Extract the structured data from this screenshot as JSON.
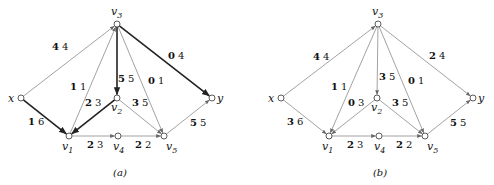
{
  "diagrams": [
    {
      "caption": "(a)",
      "caption_pos": [
        120,
        176
      ],
      "nodes": {
        "x": {
          "label": "x",
          "pos": [
            21,
            98
          ],
          "lpos": [
            8,
            102
          ]
        },
        "v1": {
          "label": "v1",
          "pos": [
            69,
            136
          ],
          "lpos": [
            62,
            150
          ]
        },
        "v2": {
          "label": "v2",
          "pos": [
            117,
            98
          ],
          "lpos": [
            111,
            111
          ]
        },
        "v3": {
          "label": "v3",
          "pos": [
            117,
            24
          ],
          "lpos": [
            111,
            15
          ]
        },
        "v4": {
          "label": "v4",
          "pos": [
            118,
            136
          ],
          "lpos": [
            113,
            150
          ]
        },
        "v5": {
          "label": "v5",
          "pos": [
            164,
            136
          ],
          "lpos": [
            166,
            150
          ]
        },
        "y": {
          "label": "y",
          "pos": [
            212,
            98
          ],
          "lpos": [
            217,
            102
          ]
        }
      },
      "edges": [
        {
          "from": "x",
          "to": "v3",
          "flow": "4",
          "cap": "4",
          "heavy": false,
          "lpos": [
            52,
            50
          ]
        },
        {
          "from": "x",
          "to": "v1",
          "flow": "1",
          "cap": "6",
          "heavy": true,
          "lpos": [
            28,
            125
          ]
        },
        {
          "from": "v1",
          "to": "v3",
          "flow": "1",
          "cap": "1",
          "heavy": false,
          "lpos": [
            70,
            90
          ]
        },
        {
          "from": "v2",
          "to": "v1",
          "flow": "2",
          "cap": "3",
          "heavy": true,
          "lpos": [
            85,
            106
          ]
        },
        {
          "from": "v3",
          "to": "v2",
          "flow": "5",
          "cap": "5",
          "heavy": true,
          "lpos": [
            118,
            82
          ]
        },
        {
          "from": "v3",
          "to": "v5",
          "flow": "0",
          "cap": "1",
          "heavy": false,
          "lpos": [
            148,
            84
          ]
        },
        {
          "from": "v3",
          "to": "y",
          "flow": "0",
          "cap": "4",
          "heavy": true,
          "lpos": [
            168,
            59
          ]
        },
        {
          "from": "v2",
          "to": "v5",
          "flow": "3",
          "cap": "5",
          "heavy": false,
          "lpos": [
            132,
            106
          ]
        },
        {
          "from": "v1",
          "to": "v4",
          "flow": "2",
          "cap": "3",
          "heavy": false,
          "lpos": [
            87,
            148
          ]
        },
        {
          "from": "v4",
          "to": "v5",
          "flow": "2",
          "cap": "2",
          "heavy": false,
          "lpos": [
            135,
            148
          ]
        },
        {
          "from": "v5",
          "to": "y",
          "flow": "5",
          "cap": "5",
          "heavy": false,
          "lpos": [
            190,
            126
          ]
        }
      ]
    },
    {
      "caption": "(b)",
      "caption_pos": [
        380,
        176
      ],
      "nodes": {
        "x": {
          "label": "x",
          "pos": [
            281,
            98
          ],
          "lpos": [
            268,
            102
          ]
        },
        "v1": {
          "label": "v1",
          "pos": [
            329,
            136
          ],
          "lpos": [
            322,
            150
          ]
        },
        "v2": {
          "label": "v2",
          "pos": [
            377,
            98
          ],
          "lpos": [
            371,
            111
          ]
        },
        "v3": {
          "label": "v3",
          "pos": [
            378,
            24
          ],
          "lpos": [
            372,
            15
          ]
        },
        "v4": {
          "label": "v4",
          "pos": [
            379,
            136
          ],
          "lpos": [
            374,
            150
          ]
        },
        "v5": {
          "label": "v5",
          "pos": [
            425,
            136
          ],
          "lpos": [
            427,
            150
          ]
        },
        "y": {
          "label": "y",
          "pos": [
            473,
            98
          ],
          "lpos": [
            478,
            102
          ]
        }
      },
      "edges": [
        {
          "from": "x",
          "to": "v3",
          "flow": "4",
          "cap": "4",
          "heavy": false,
          "lpos": [
            313,
            60
          ]
        },
        {
          "from": "x",
          "to": "v1",
          "flow": "3",
          "cap": "6",
          "heavy": false,
          "lpos": [
            287,
            125
          ]
        },
        {
          "from": "v3",
          "to": "v1",
          "flow": "1",
          "cap": "1",
          "heavy": false,
          "lpos": [
            331,
            90
          ]
        },
        {
          "from": "v2",
          "to": "v1",
          "flow": "0",
          "cap": "3",
          "heavy": false,
          "lpos": [
            348,
            106
          ]
        },
        {
          "from": "v3",
          "to": "v2",
          "flow": "3",
          "cap": "5",
          "heavy": false,
          "lpos": [
            379,
            80
          ]
        },
        {
          "from": "v3",
          "to": "v5",
          "flow": "0",
          "cap": "1",
          "heavy": false,
          "lpos": [
            408,
            84
          ]
        },
        {
          "from": "v3",
          "to": "y",
          "flow": "2",
          "cap": "4",
          "heavy": false,
          "lpos": [
            429,
            59
          ]
        },
        {
          "from": "v2",
          "to": "v5",
          "flow": "3",
          "cap": "5",
          "heavy": false,
          "lpos": [
            392,
            106
          ]
        },
        {
          "from": "v1",
          "to": "v4",
          "flow": "2",
          "cap": "3",
          "heavy": false,
          "lpos": [
            347,
            148
          ]
        },
        {
          "from": "v4",
          "to": "v5",
          "flow": "2",
          "cap": "2",
          "heavy": false,
          "lpos": [
            396,
            148
          ]
        },
        {
          "from": "v5",
          "to": "y",
          "flow": "5",
          "cap": "5",
          "heavy": false,
          "lpos": [
            450,
            126
          ]
        }
      ]
    }
  ],
  "colors": {
    "light_edge": "#8a8a8a",
    "heavy_edge": "#222222",
    "node_fill": "#ffffff",
    "node_stroke": "#333333"
  }
}
